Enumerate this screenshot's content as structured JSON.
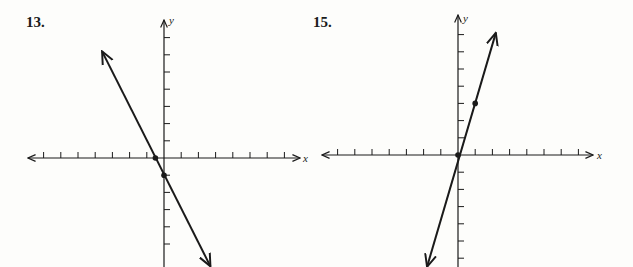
{
  "problems": [
    {
      "number": "13.",
      "x_axis_label": "x",
      "y_axis_label": "y"
    },
    {
      "number": "15.",
      "x_axis_label": "x",
      "y_axis_label": "y"
    }
  ],
  "chart_data": [
    {
      "type": "line",
      "title": "13.",
      "xlabel": "x",
      "ylabel": "y",
      "equation": "y = -2x - 1",
      "marked_points": [
        {
          "x": -0.5,
          "y": 0
        },
        {
          "x": 0,
          "y": -1
        }
      ],
      "x_ticks": [
        -7,
        -6,
        -5,
        -4,
        -3,
        -2,
        -1,
        1,
        2,
        3,
        4,
        5,
        6,
        7
      ],
      "y_ticks": [
        -5,
        -4,
        -3,
        -2,
        -1,
        1,
        2,
        3,
        4,
        5,
        6,
        7
      ],
      "xlim": [
        -8,
        8
      ],
      "ylim": [
        -6,
        8
      ],
      "grid": false,
      "line_endpoints": [
        {
          "x": -3.6,
          "y": 6.2
        },
        {
          "x": 2.7,
          "y": -6.3
        }
      ],
      "arrows": "both ends"
    },
    {
      "type": "line",
      "title": "15.",
      "xlabel": "x",
      "ylabel": "y",
      "equation": "y = 3x",
      "marked_points": [
        {
          "x": 0,
          "y": 0
        },
        {
          "x": 1,
          "y": 3
        }
      ],
      "x_ticks": [
        -7,
        -6,
        -5,
        -4,
        -3,
        -2,
        -1,
        1,
        2,
        3,
        4,
        5,
        6,
        7
      ],
      "y_ticks": [
        -6,
        -5,
        -4,
        -3,
        -2,
        -1,
        1,
        2,
        3,
        4,
        5,
        6,
        7
      ],
      "xlim": [
        -8,
        8
      ],
      "ylim": [
        -6,
        8
      ],
      "grid": false,
      "line_endpoints": [
        {
          "x": -1.8,
          "y": -6.5
        },
        {
          "x": 2.2,
          "y": 7.1
        }
      ],
      "arrows": "both ends"
    }
  ]
}
